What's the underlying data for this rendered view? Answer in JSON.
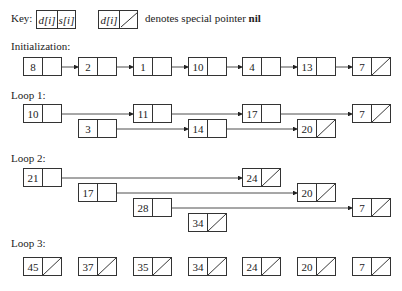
{
  "key": {
    "label": "Key:",
    "cell_d": "d[i]",
    "cell_s": "s[i]",
    "nil_cell_d": "d[i]",
    "description": "denotes special pointer",
    "nil_word": "nil"
  },
  "sections": {
    "init": {
      "label": "Initialization:"
    },
    "loop1": {
      "label": "Loop 1:"
    },
    "loop2": {
      "label": "Loop 2:"
    },
    "loop3": {
      "label": "Loop 3:"
    }
  },
  "nodes": {
    "init": [
      "8",
      "2",
      "1",
      "10",
      "4",
      "13",
      "7"
    ],
    "loop1": [
      "10",
      "11",
      "17",
      "7",
      "3",
      "14",
      "20"
    ],
    "loop2": [
      "21",
      "24",
      "17",
      "20",
      "28",
      "7",
      "34"
    ],
    "loop3": [
      "45",
      "37",
      "35",
      "34",
      "24",
      "20",
      "7"
    ]
  }
}
